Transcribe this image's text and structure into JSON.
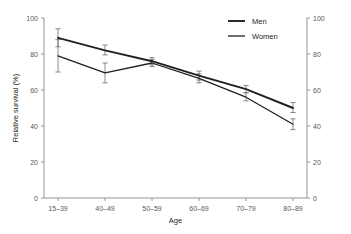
{
  "chart_data": {
    "type": "line",
    "title": "",
    "xlabel": "Age",
    "ylabel": "Relative survival (%)",
    "categories": [
      "15–39",
      "40–49",
      "50–59",
      "60–69",
      "70–79",
      "80–89"
    ],
    "ylim": [
      0,
      100
    ],
    "yticks": [
      0,
      20,
      40,
      60,
      80,
      100
    ],
    "ytick_labels": [
      "0",
      "20",
      "40",
      "60",
      "80",
      "100"
    ],
    "right_axis": {
      "ticks": [
        0,
        20,
        40,
        60,
        80,
        100
      ],
      "tick_labels": [
        "0",
        "20",
        "40",
        "60",
        "80",
        "100"
      ],
      "mirror_of_left": true
    },
    "grid": false,
    "legend_position": "top-right",
    "series": [
      {
        "name": "Men",
        "color": "#231f20",
        "line_width": 1.9,
        "values": [
          89,
          82,
          76,
          68,
          60.5,
          50
        ],
        "err_low": [
          84,
          79.5,
          74,
          65.5,
          58.5,
          47.5
        ],
        "err_high": [
          94,
          85,
          78,
          70.5,
          62.5,
          53
        ]
      },
      {
        "name": "Women",
        "color": "#231f20",
        "line_width": 1.3,
        "values": [
          79,
          69.5,
          75,
          66.5,
          56,
          41
        ],
        "err_low": [
          70,
          64,
          73,
          64,
          54,
          38
        ],
        "err_high": [
          88,
          75,
          77,
          69,
          58.5,
          44
        ]
      }
    ]
  },
  "legend": {
    "items": [
      {
        "label": "Men"
      },
      {
        "label": "Women"
      }
    ]
  },
  "colors": {
    "ink": "#231f20",
    "axis": "#939598",
    "tick_text": "#58595b",
    "error_bar": "#6d6e71"
  }
}
